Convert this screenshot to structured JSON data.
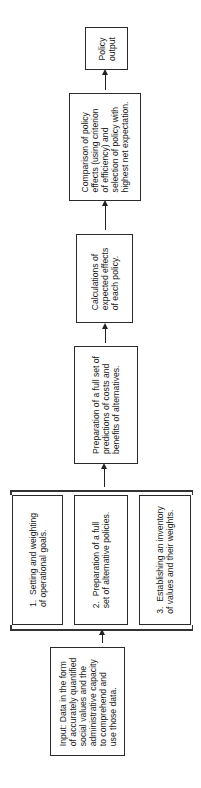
{
  "diagram": {
    "orientation": "rotated 90° counter-clockwise; flow runs bottom to top",
    "nodes": {
      "output": {
        "label": "Policy\noutput"
      },
      "comparison": {
        "label": "Comparison of policy\neffects (using criterion\nof efficiency) and\nselection of policy with\nhighest net expectation."
      },
      "calculations": {
        "label": "Calculations of\nexpected effects\nof each policy."
      },
      "predictions": {
        "label": "Preparation of a full set of\npredictions of costs and\nbenefits of alternatives."
      },
      "group": {
        "items": [
          {
            "label": "1.  Setting and weighting\nof operational goals."
          },
          {
            "label": "2.  Preparation of a full\nset of alternative policies."
          },
          {
            "label": "3.  Establishing an inventory\nof values and their weights."
          }
        ]
      },
      "input": {
        "label": "Input: Data in the form\nof accurately quantified\nsocial values and the\nadministrative capacity\nto comprehend and\nuse those data."
      }
    },
    "edges": [
      {
        "from": "input",
        "to": "group"
      },
      {
        "from": "group",
        "to": "predictions"
      },
      {
        "from": "predictions",
        "to": "calculations"
      },
      {
        "from": "calculations",
        "to": "comparison"
      },
      {
        "from": "comparison",
        "to": "output"
      }
    ],
    "colors": {
      "line": "#222222",
      "background": "#ffffff",
      "text": "#1a1a1a"
    }
  }
}
